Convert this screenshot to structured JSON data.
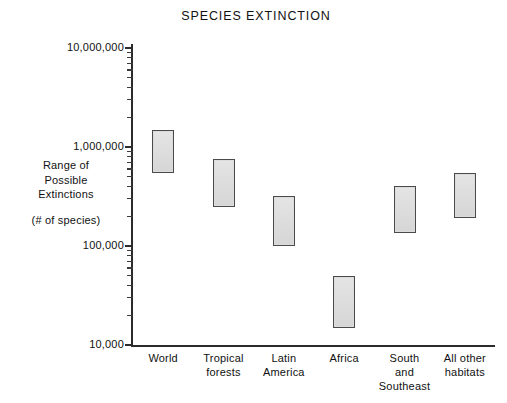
{
  "chart_data": {
    "type": "bar",
    "title": "SPECIES EXTINCTION",
    "xlabel": "",
    "ylabel": "Range of Possible Extinctions (# of species)",
    "yscale": "log",
    "ylim": [
      10000,
      10000000
    ],
    "ytick_labels": [
      "10,000,000",
      "1,000,000",
      "100,000",
      "10,000"
    ],
    "ytick_values": [
      10000000,
      1000000,
      100000,
      10000
    ],
    "grid": false,
    "legend": null,
    "categories": [
      "World",
      "Tropical forests",
      "Latin America",
      "Africa",
      "South and Southeast",
      "All other habitats"
    ],
    "series": [
      {
        "name": "Range of Possible Extinctions",
        "low": [
          550000,
          250000,
          100000,
          15000,
          135000,
          190000
        ],
        "high": [
          1500000,
          750000,
          320000,
          50000,
          400000,
          550000
        ]
      }
    ]
  },
  "chart": {
    "title": "SPECIES EXTINCTION",
    "y_axis": {
      "caption_lines": [
        "Range of",
        "Possible",
        "Extinctions"
      ],
      "units_label": "(# of species)",
      "ticks": [
        {
          "label": "10,000,000",
          "value": 10000000
        },
        {
          "label": "1,000,000",
          "value": 1000000
        },
        {
          "label": "100,000",
          "value": 100000
        },
        {
          "label": "10,000",
          "value": 10000
        }
      ]
    },
    "x_axis": {
      "categories": [
        {
          "lines": [
            "World"
          ]
        },
        {
          "lines": [
            "Tropical",
            "forests"
          ]
        },
        {
          "lines": [
            "Latin",
            "America"
          ]
        },
        {
          "lines": [
            "Africa"
          ]
        },
        {
          "lines": [
            "South",
            "and",
            "Southeast"
          ]
        },
        {
          "lines": [
            "All other",
            "habitats"
          ]
        }
      ]
    },
    "bars": [
      {
        "category": "World",
        "low": 550000,
        "high": 1500000
      },
      {
        "category": "Tropical forests",
        "low": 250000,
        "high": 750000
      },
      {
        "category": "Latin America",
        "low": 100000,
        "high": 320000
      },
      {
        "category": "Africa",
        "low": 15000,
        "high": 50000
      },
      {
        "category": "South and Southeast",
        "low": 135000,
        "high": 400000
      },
      {
        "category": "All other habitats",
        "low": 190000,
        "high": 550000
      }
    ],
    "colors": {
      "bar_fill": "#dcdcdc",
      "bar_border": "#4a4a4a",
      "axis": "#2b2b2b",
      "text": "#111111",
      "background": "#ffffff"
    }
  }
}
